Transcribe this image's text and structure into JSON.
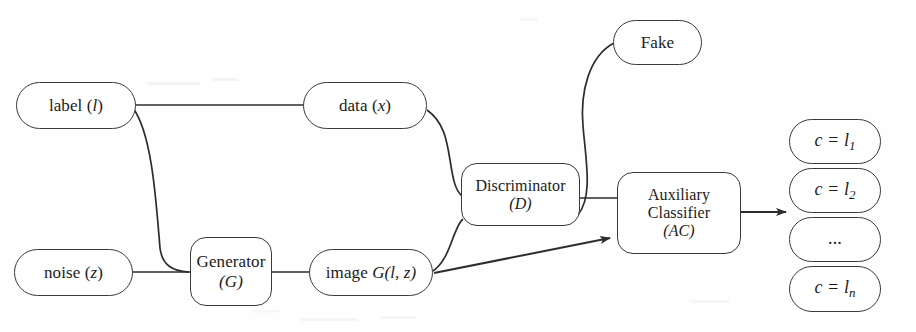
{
  "figure": {
    "kind": "flow-diagram",
    "background_color": "#ffffff",
    "stroke_color": "#3a3a3a",
    "text_color": "#1b1b1b"
  },
  "nodes": {
    "label": {
      "text": "label (",
      "var": "l",
      "close": ")",
      "shape": "pill"
    },
    "noise": {
      "text": "noise (",
      "var": "z",
      "close": ")",
      "shape": "pill"
    },
    "generator": {
      "line1": "Generator",
      "line2": "(G)",
      "shape": "rounded-rect"
    },
    "data": {
      "text": "data (",
      "var": "x",
      "close": ")",
      "shape": "pill"
    },
    "image": {
      "text": "image ",
      "var": "G(l, z)",
      "shape": "pill"
    },
    "discriminator": {
      "line1": "Discriminator",
      "line2": "(D)",
      "shape": "rounded-rect"
    },
    "fake": {
      "text": "Fake",
      "shape": "pill"
    },
    "auxiliary_classifier": {
      "line1": "Auxiliary",
      "line2": "Classifier",
      "line3": "(AC)",
      "shape": "rounded-rect"
    },
    "out1": {
      "lhs": "c = l",
      "sub": "1",
      "shape": "pill"
    },
    "out2": {
      "lhs": "c = l",
      "sub": "2",
      "shape": "pill"
    },
    "out3": {
      "lhs": "...",
      "sub": "",
      "shape": "pill"
    },
    "outn": {
      "lhs": "c = l",
      "sub": "n",
      "shape": "pill"
    }
  },
  "edges": [
    {
      "name": "label-to-data",
      "from": "label",
      "to": "data",
      "arrowhead": true,
      "style": "straight"
    },
    {
      "name": "label-to-generator",
      "from": "label",
      "to": "generator",
      "arrowhead": false,
      "style": "curved"
    },
    {
      "name": "noise-to-generator",
      "from": "noise",
      "to": "generator",
      "arrowhead": false,
      "style": "straight"
    },
    {
      "name": "generator-to-image",
      "from": "generator",
      "to": "image",
      "arrowhead": true,
      "style": "straight"
    },
    {
      "name": "data-to-discriminator",
      "from": "data",
      "to": "discriminator",
      "arrowhead": false,
      "style": "curved"
    },
    {
      "name": "image-to-discriminator",
      "from": "image",
      "to": "discriminator",
      "arrowhead": false,
      "style": "curved"
    },
    {
      "name": "discriminator-to-fake",
      "from": "discriminator",
      "to": "fake",
      "arrowhead": false,
      "style": "curved"
    },
    {
      "name": "discriminator-to-auxiliary-classifier",
      "from": "discriminator",
      "to": "auxiliary_classifier",
      "arrowhead": false,
      "style": "straight"
    },
    {
      "name": "image-to-auxiliary-classifier",
      "from": "image",
      "to": "auxiliary_classifier",
      "arrowhead": true,
      "style": "straight"
    },
    {
      "name": "auxiliary-classifier-to-outputs",
      "from": "auxiliary_classifier",
      "to": "out2",
      "arrowhead": true,
      "style": "straight"
    }
  ]
}
